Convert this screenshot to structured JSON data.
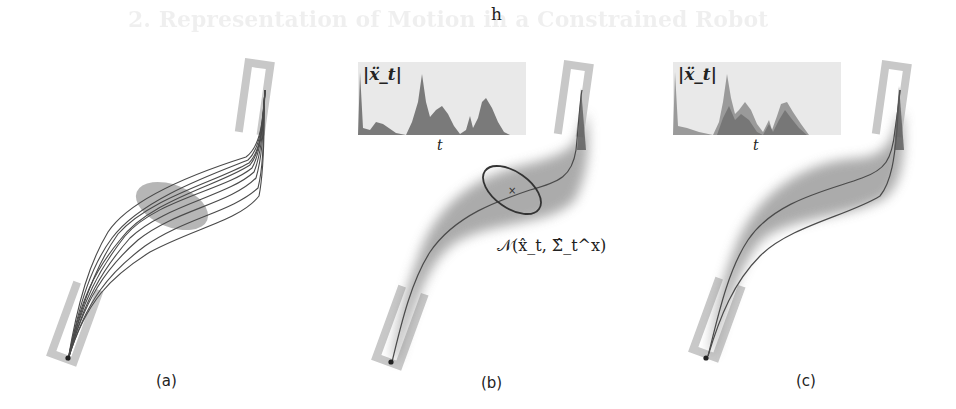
{
  "figure": {
    "top_label": "h",
    "background_ghost_text": {
      "title": "2. Representation of Motion in a Constrained Robot",
      "lines": []
    },
    "panels": [
      {
        "id": "a",
        "label": "(a)",
        "content": "demonstration trajectories with ellipse obstacle",
        "start_slot": "bottom-left U slot",
        "goal_slot": "top-right U slot"
      },
      {
        "id": "b",
        "label": "(b)",
        "content": "mean trajectory with variance tube and covariance ellipse",
        "inset": {
          "ylabel": "|ẍ_t|",
          "xlabel": "t"
        },
        "annotation": "𝒩(x̂_t, Σ̂_t^x)"
      },
      {
        "id": "c",
        "label": "(c)",
        "content": "two reproduced trajectories within variance tube",
        "inset": {
          "ylabel": "|ẍ_t|",
          "xlabel": "t"
        }
      }
    ],
    "colors": {
      "slot_gray": "#c8c8c8",
      "ellipse_fill": "#a9a9a9",
      "traj_line": "#4a4a4a",
      "tube_gray": "#8f8f8f",
      "inset_bg": "#e9e9e9",
      "inset_fill_dark": "#7a7a7a",
      "inset_fill_light": "#9a9a9a"
    }
  }
}
